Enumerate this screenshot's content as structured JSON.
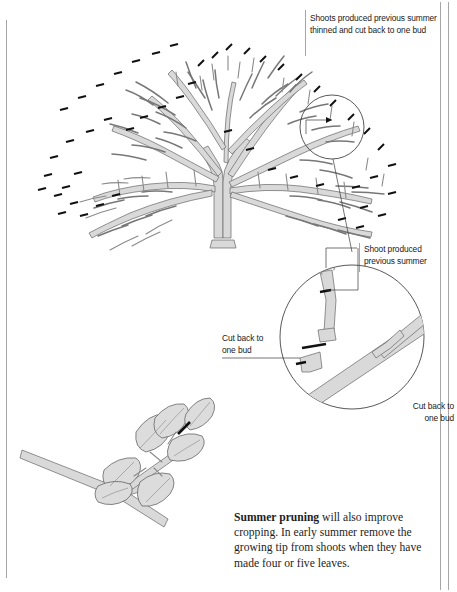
{
  "page": {
    "background": "#ffffff",
    "width": 457,
    "height": 592
  },
  "colors": {
    "branch_fill": "#d9d9d9",
    "branch_stroke": "#5a5a5a",
    "cut_mark": "#111111",
    "leaf_fill": "#dcdcdc",
    "rule": "#8a8a8a",
    "text": "#1a1a1a"
  },
  "captions": {
    "top": "Shoots produced previous summer thinned and cut back to one bud",
    "top_line1": "Shoots produced previous summer",
    "top_line2": "thinned and cut back to one bud",
    "shoot_detail": "Shoot produced previous summer",
    "shoot_detail_line1": "Shoot produced",
    "shoot_detail_line2": "previous summer",
    "cut_back_left": "Cut back to one bud",
    "cut_back_left_line1": "Cut back to",
    "cut_back_left_line2": "one bud",
    "cut_back_right": "Cut back to one bud",
    "cut_back_right_line1": "Cut back to",
    "cut_back_right_line2": "one bud"
  },
  "body": {
    "lead": "Summer pruning",
    "rest": " will also improve cropping. In early summer remove the growing tip from shoots when they have made four or five leaves."
  },
  "figures": {
    "tree": "bare-fruit-tree-winter-pruning-diagram",
    "detail_circle": "magnified-shoot-cut-back-to-one-bud",
    "leafy_shoot": "summer-pruning-leafy-shoot-pinch-out"
  }
}
